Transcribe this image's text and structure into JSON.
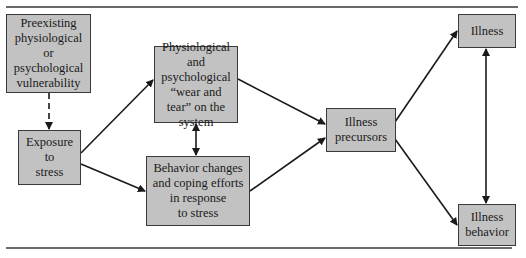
{
  "diagram": {
    "nodes": [
      {
        "id": "preexisting",
        "label": "Preexisting\nphysiological\nor\npsychological\nvulnerability"
      },
      {
        "id": "exposure",
        "label": "Exposure\nto\nstress"
      },
      {
        "id": "wear_tear",
        "label": "Physiological\nand\npsychological\n“wear and\ntear” on the\nsystem"
      },
      {
        "id": "behavior_changes",
        "label": "Behavior changes\nand coping efforts\nin response\nto stress"
      },
      {
        "id": "precursors",
        "label": "Illness\nprecursors"
      },
      {
        "id": "illness",
        "label": "Illness"
      },
      {
        "id": "illness_behavior",
        "label": "Illness\nbehavior"
      }
    ],
    "edges": [
      {
        "from": "preexisting",
        "to": "exposure",
        "style": "dashed"
      },
      {
        "from": "exposure",
        "to": "wear_tear",
        "style": "solid"
      },
      {
        "from": "exposure",
        "to": "behavior_changes",
        "style": "solid"
      },
      {
        "from": "wear_tear",
        "to": "behavior_changes",
        "style": "solid",
        "bidirectional": true
      },
      {
        "from": "wear_tear",
        "to": "precursors",
        "style": "solid"
      },
      {
        "from": "behavior_changes",
        "to": "precursors",
        "style": "solid"
      },
      {
        "from": "precursors",
        "to": "illness",
        "style": "solid"
      },
      {
        "from": "precursors",
        "to": "illness_behavior",
        "style": "solid"
      },
      {
        "from": "illness",
        "to": "illness_behavior",
        "style": "solid",
        "bidirectional": true
      }
    ]
  },
  "colors": {
    "box_fill": "#c2c2c2",
    "box_border": "#3a3a3a",
    "line": "#1a1a1a",
    "rule": "#6a6a6a"
  }
}
